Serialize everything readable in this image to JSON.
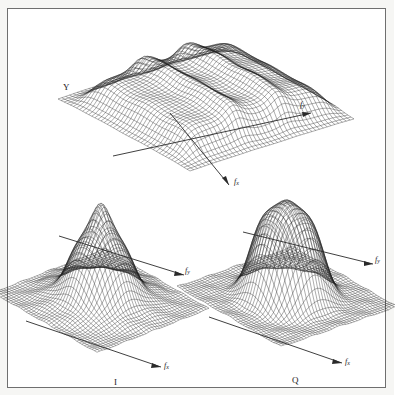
{
  "figure": {
    "background_color": "#ffffff",
    "frame_color": "#6f6f6f",
    "mesh_color": "#1d1d1d",
    "axis_color": "#2a2a2a"
  },
  "panels": {
    "top": {
      "name": "Y",
      "label": "Y",
      "axis_x": {
        "label": "f",
        "sub": "x"
      },
      "axis_y": {
        "label": "f",
        "sub": "y"
      },
      "description": "plateau / staircase mesh surface"
    },
    "bottom_left": {
      "name": "I",
      "label": "I",
      "axis_x": {
        "label": "f",
        "sub": "x"
      },
      "axis_y": {
        "label": "f",
        "sub": "y"
      },
      "description": "single broad peak mesh surface on flat base"
    },
    "bottom_right": {
      "name": "Q",
      "label": "Q",
      "axis_x": {
        "label": "f",
        "sub": "x"
      },
      "axis_y": {
        "label": "f",
        "sub": "y"
      },
      "description": "single flat-topped peak mesh surface on flat base"
    }
  },
  "chart_data": {
    "type": "surface",
    "title": "",
    "xlabel": "f_x",
    "ylabel": "f_y",
    "zlabel": "",
    "grid": false,
    "legend": "none",
    "panels": [
      {
        "id": "Y",
        "label": "Y",
        "type": "surface",
        "surface_form": "multi-level plateau (staircase) spectrum",
        "x": [
          -1.0,
          -0.8,
          -0.6,
          -0.4,
          -0.2,
          0.0,
          0.2,
          0.4,
          0.6,
          0.8,
          1.0
        ],
        "y": [
          -1.0,
          -0.8,
          -0.6,
          -0.4,
          -0.2,
          0.0,
          0.2,
          0.4,
          0.6,
          0.8,
          1.0
        ],
        "z_levels": [
          0.0,
          0.35,
          0.7,
          1.0
        ],
        "zlim": [
          0,
          1.0
        ],
        "xlim": [
          -1.0,
          1.0
        ],
        "ylim": [
          -1.0,
          1.0
        ],
        "nx": 40,
        "ny": 40
      },
      {
        "id": "I",
        "label": "I",
        "type": "surface",
        "surface_form": "gaussian-like main lobe with sidelobe ripples on flat baseline",
        "peak_value": 1.0,
        "peak_location": [
          0.0,
          0.0
        ],
        "zlim": [
          0,
          1.0
        ],
        "xlim": [
          -1.0,
          1.0
        ],
        "ylim": [
          -1.0,
          1.0
        ],
        "nx": 40,
        "ny": 40
      },
      {
        "id": "Q",
        "label": "Q",
        "type": "surface",
        "surface_form": "flat-topped super-gaussian lobe on flat baseline",
        "peak_value": 1.0,
        "peak_location": [
          0.0,
          0.0
        ],
        "zlim": [
          0,
          1.0
        ],
        "xlim": [
          -1.0,
          1.0
        ],
        "ylim": [
          -1.0,
          1.0
        ],
        "nx": 40,
        "ny": 40
      }
    ]
  }
}
